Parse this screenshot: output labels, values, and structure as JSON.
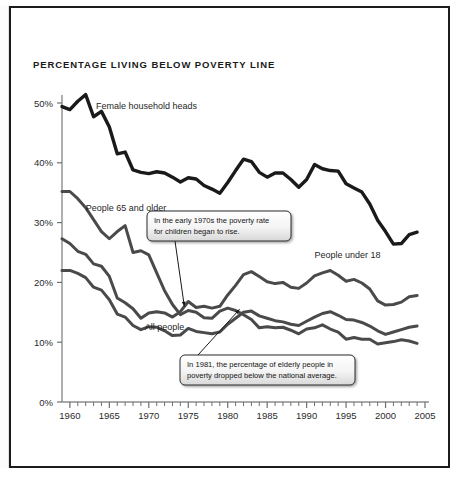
{
  "chart_data": {
    "type": "line",
    "title": "PERCENTAGE LIVING BELOW POVERTY LINE",
    "xlabel": "",
    "ylabel": "",
    "xlim": [
      1959,
      2005
    ],
    "ylim": [
      0,
      50
    ],
    "grid": false,
    "legend_position": "inline-labels",
    "x_ticks": [
      1960,
      1965,
      1970,
      1975,
      1980,
      1985,
      1990,
      1995,
      2000,
      2005
    ],
    "x_tick_labels": [
      "1960",
      "1965",
      "1970",
      "1975",
      "1980",
      "1985",
      "1990",
      "1995",
      "2000",
      "2005"
    ],
    "y_ticks": [
      0,
      10,
      20,
      30,
      40,
      50
    ],
    "y_tick_labels": [
      "0%",
      "10%",
      "20%",
      "30%",
      "40%",
      "50%"
    ],
    "x": [
      1959,
      1960,
      1961,
      1962,
      1963,
      1964,
      1965,
      1966,
      1967,
      1968,
      1969,
      1970,
      1971,
      1972,
      1973,
      1974,
      1975,
      1976,
      1977,
      1978,
      1979,
      1980,
      1981,
      1982,
      1983,
      1984,
      1985,
      1986,
      1987,
      1988,
      1989,
      1990,
      1991,
      1992,
      1993,
      1994,
      1995,
      1996,
      1997,
      1998,
      1999,
      2000,
      2001,
      2002,
      2003,
      2004
    ],
    "series": [
      {
        "name": "Female household heads",
        "color": "#1a1a1a",
        "width": 3.4,
        "label_x": 1963.3,
        "label_y": 49.0,
        "values": [
          49.4,
          48.9,
          50.3,
          51.4,
          47.7,
          48.6,
          46.0,
          41.5,
          41.8,
          38.8,
          38.4,
          38.2,
          38.5,
          38.3,
          37.6,
          36.8,
          37.5,
          37.3,
          36.2,
          35.6,
          34.9,
          36.7,
          38.7,
          40.6,
          40.2,
          38.4,
          37.6,
          38.3,
          38.3,
          37.2,
          35.9,
          37.2,
          39.7,
          39.0,
          38.7,
          38.6,
          36.5,
          35.8,
          35.1,
          33.1,
          30.4,
          28.5,
          26.4,
          26.5,
          28.0,
          28.4
        ]
      },
      {
        "name": "People 65 and older",
        "color": "#4a4a4a",
        "width": 3.0,
        "label_x": 1962.0,
        "label_y": 32.0,
        "values": [
          35.2,
          35.2,
          34.0,
          32.5,
          30.5,
          28.5,
          27.3,
          28.5,
          29.5,
          25.0,
          25.3,
          24.6,
          21.6,
          18.6,
          16.3,
          14.6,
          15.3,
          15.0,
          14.1,
          14.0,
          15.2,
          15.7,
          15.3,
          14.6,
          13.8,
          12.4,
          12.6,
          12.4,
          12.5,
          12.0,
          11.4,
          12.2,
          12.4,
          12.9,
          12.2,
          11.7,
          10.5,
          10.8,
          10.5,
          10.5,
          9.7,
          9.9,
          10.1,
          10.4,
          10.2,
          9.8
        ]
      },
      {
        "name": "People under 18",
        "color": "#4a4a4a",
        "width": 3.0,
        "label_x": 1991.0,
        "label_y": 24.0,
        "values": [
          27.3,
          26.5,
          25.2,
          24.7,
          23.1,
          22.7,
          21.0,
          17.4,
          16.6,
          15.6,
          14.0,
          14.9,
          15.1,
          14.9,
          14.2,
          15.1,
          16.8,
          15.8,
          16.0,
          15.7,
          16.0,
          17.9,
          19.5,
          21.3,
          21.8,
          21.0,
          20.1,
          19.8,
          20.0,
          19.2,
          19.0,
          19.9,
          21.1,
          21.6,
          22.0,
          21.2,
          20.2,
          20.5,
          19.9,
          18.9,
          16.9,
          16.2,
          16.3,
          16.7,
          17.6,
          17.8
        ]
      },
      {
        "name": "All people",
        "color": "#4a4a4a",
        "width": 3.0,
        "label_x": 1969.5,
        "label_y": 12.0,
        "values": [
          22.0,
          22.0,
          21.5,
          20.8,
          19.2,
          18.7,
          17.1,
          14.7,
          14.2,
          12.8,
          12.1,
          12.6,
          12.5,
          11.9,
          11.1,
          11.2,
          12.3,
          11.8,
          11.6,
          11.4,
          11.7,
          13.0,
          14.0,
          15.0,
          15.2,
          14.4,
          14.0,
          13.6,
          13.4,
          13.0,
          12.8,
          13.5,
          14.2,
          14.8,
          15.1,
          14.5,
          13.8,
          13.7,
          13.3,
          12.7,
          11.9,
          11.3,
          11.7,
          12.1,
          12.5,
          12.7
        ]
      }
    ],
    "annotations": [
      {
        "id": "children-rise",
        "lines": [
          "In the early 1970s the poverty rate",
          "for children began to rise."
        ],
        "target_x": 1974.5,
        "target_y": 16.0
      },
      {
        "id": "elderly-drop",
        "lines": [
          "In 1981, the percentage of elderly people in",
          "poverty dropped below the national average."
        ],
        "target_x": 1981.5,
        "target_y": 15.5
      }
    ]
  }
}
